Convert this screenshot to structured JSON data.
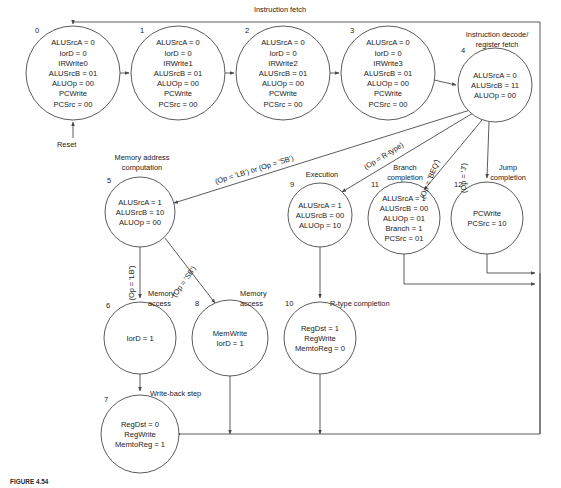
{
  "figure": {
    "caption_id": "FIGURE 4.54",
    "caption_text": ""
  },
  "diagram": {
    "title": "Instruction fetch",
    "type": "finite-state-machine",
    "reset_label": "Reset",
    "group_labels": {
      "instruction_fetch": "Instruction fetch",
      "instruction_decode": "Instruction decode/",
      "instruction_decode2": "register fetch",
      "memory_address": "Memory address",
      "memory_address2": "computation",
      "execution": "Execution",
      "branch_completion": "Branch",
      "branch_completion2": "completion",
      "jump_completion": "Jump",
      "jump_completion2": "completion",
      "memory_access_lb": "Memory",
      "memory_access_lb2": "access",
      "memory_access_sb": "Memory",
      "memory_access_sb2": "access",
      "rtype_completion": "R-type completion",
      "writeback_step": "Write-back step"
    },
    "states": [
      {
        "id": "0",
        "cx": 73,
        "cy": 73,
        "r": 47,
        "num_x": 35,
        "num_y": 33,
        "lines": [
          "ALUSrcA = 0",
          "IorD = 0",
          "IRWrite0",
          "ALUSrcB = 01",
          "ALUOp = 00",
          "PCWrite",
          "PCSrc = 00"
        ]
      },
      {
        "id": "1",
        "cx": 178,
        "cy": 73,
        "r": 47,
        "num_x": 140,
        "num_y": 33,
        "lines": [
          "ALUSrcA = 0",
          "IorD = 0",
          "IRWrite1",
          "ALUSrcB = 01",
          "ALUOp = 00",
          "PCWrite",
          "PCSrc = 00"
        ]
      },
      {
        "id": "2",
        "cx": 283,
        "cy": 73,
        "r": 47,
        "num_x": 245,
        "num_y": 33,
        "lines": [
          "ALUSrcA = 0",
          "IorD = 0",
          "IRWrite2",
          "ALUSrcB = 01",
          "ALUOp = 00",
          "PCWrite",
          "PCSrc = 00"
        ]
      },
      {
        "id": "3",
        "cx": 388,
        "cy": 73,
        "r": 47,
        "num_x": 350,
        "num_y": 33,
        "lines": [
          "ALUSrcA = 0",
          "IorD = 0",
          "IRWrite3",
          "ALUSrcB = 01",
          "ALUOp = 00",
          "PCWrite",
          "PCSrc = 00"
        ]
      },
      {
        "id": "4",
        "cx": 495,
        "cy": 85,
        "r": 37,
        "num_x": 461,
        "num_y": 53,
        "lines": [
          "ALUSrcA = 0",
          "ALUSrcB = 11",
          "ALUOp = 00"
        ]
      },
      {
        "id": "5",
        "cx": 140,
        "cy": 212,
        "r": 35,
        "num_x": 107,
        "num_y": 183,
        "lines": [
          "ALUSrcA = 1",
          "ALUSrcB = 10",
          "ALUOp = 00"
        ]
      },
      {
        "id": "9",
        "cx": 320,
        "cy": 215,
        "r": 32,
        "num_x": 290,
        "num_y": 187,
        "lines": [
          "ALUSrcA = 1",
          "ALUSrcB = 00",
          "ALUOp = 10"
        ]
      },
      {
        "id": "11",
        "cx": 404,
        "cy": 218,
        "r": 36,
        "num_x": 371,
        "num_y": 187,
        "lines": [
          "ALUSrcA = 1",
          "ALUSrcB = 00",
          "ALUOp = 01",
          "Branch = 1",
          "PCSrc = 01"
        ]
      },
      {
        "id": "12",
        "cx": 487,
        "cy": 218,
        "r": 36,
        "num_x": 454,
        "num_y": 187,
        "lines": [
          "PCWrite",
          "PCSrc = 10"
        ]
      },
      {
        "id": "6",
        "cx": 140,
        "cy": 338,
        "r": 36,
        "num_x": 106,
        "num_y": 308,
        "lines": [
          "IorD = 1"
        ]
      },
      {
        "id": "8",
        "cx": 230,
        "cy": 338,
        "r": 38,
        "num_x": 195,
        "num_y": 306,
        "lines": [
          "MemWrite",
          "IorD = 1"
        ]
      },
      {
        "id": "10",
        "cx": 320,
        "cy": 338,
        "r": 36,
        "num_x": 285,
        "num_y": 306,
        "lines": [
          "RegDst = 1",
          "RegWrite",
          "MemtoReg = 0"
        ]
      },
      {
        "id": "7",
        "cx": 140,
        "cy": 434,
        "r": 39,
        "num_x": 104,
        "num_y": 402,
        "lines": [
          "RegDst = 0",
          "RegWrite",
          "MemtoReg = 1"
        ]
      }
    ],
    "edge_labels": [
      {
        "id": "lb-or-sb",
        "text": "(Op = 'LB') or (Op = 'SB')",
        "x": 255,
        "y": 172,
        "rotate": -17
      },
      {
        "id": "r-type",
        "text": "(Op = R-type)",
        "x": 385,
        "y": 158,
        "rotate": -32
      },
      {
        "id": "beq",
        "text": "(Op = 'BEQ')",
        "x": 432,
        "y": 180,
        "rotate": -68
      },
      {
        "id": "jump",
        "text": "(Op = 'J')",
        "x": 466,
        "y": 178,
        "rotate": -90
      },
      {
        "id": "lb",
        "text": "(Op = 'LB')",
        "x": 134,
        "y": 283,
        "rotate": -90
      },
      {
        "id": "sb",
        "text": "(Op = 'SB')",
        "x": 186,
        "y": 283,
        "rotate": -55
      }
    ]
  }
}
